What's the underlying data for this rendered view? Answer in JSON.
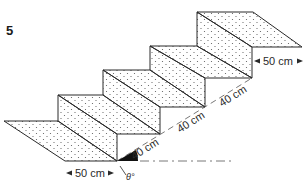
{
  "figure": {
    "number": "5",
    "colors": {
      "line": "#2a2a2a",
      "surface_fill": "#ffffff",
      "dot_pattern": "#5a5a5a",
      "angle_wedge": "#111111"
    }
  },
  "labels": {
    "landing_width_bottom": "50 cm",
    "landing_width_top": "50 cm",
    "slope_segments": [
      "40 cm",
      "40 cm",
      "40 cm"
    ],
    "angle": "θ°"
  },
  "geometry": {
    "step_count": 3,
    "surfaces": [
      {
        "name": "bottom-landing",
        "points": "4,121 58,121 117,161 65,161"
      },
      {
        "name": "riser-1",
        "points": "58,121 58,95 117,134 117,161"
      },
      {
        "name": "tread-1",
        "points": "58,95 103,95 160,134 117,134"
      },
      {
        "name": "riser-2",
        "points": "103,95 103,70 160,107 160,134"
      },
      {
        "name": "tread-2",
        "points": "103,70 150,70 205,107 160,107"
      },
      {
        "name": "riser-3",
        "points": "150,70 150,46 205,78 205,107"
      },
      {
        "name": "tread-3",
        "points": "150,46 197,46 252,78 205,78"
      },
      {
        "name": "riser-4",
        "points": "197,46 197,12 252,47 252,78"
      },
      {
        "name": "top-landing",
        "points": "197,12 253,12 302,47 252,47"
      }
    ]
  }
}
